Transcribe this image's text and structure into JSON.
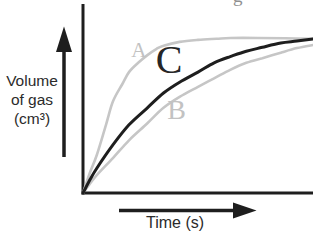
{
  "figure": {
    "cropped_text_fragment": "g",
    "background_color": "#ffffff"
  },
  "chart_data": {
    "type": "line",
    "title": "",
    "xlabel": "Time (s)",
    "ylabel": "Volume of gas (cm³)",
    "ylabel_lines": [
      "Volume",
      "of gas",
      "(cm³)"
    ],
    "x_range": [
      0,
      100
    ],
    "y_range": [
      0,
      100
    ],
    "grid": false,
    "axis_arrows": true,
    "axis_color": "#1e1e1e",
    "text_color": "#2b2b2b",
    "series": [
      {
        "name": "A",
        "color": "#c6c6c6",
        "points": [
          [
            0,
            0
          ],
          [
            3,
            13
          ],
          [
            6,
            24.5
          ],
          [
            10,
            44
          ],
          [
            13,
            59
          ],
          [
            17,
            70
          ],
          [
            20,
            78
          ],
          [
            24,
            84
          ],
          [
            28,
            89
          ],
          [
            32,
            93
          ],
          [
            35,
            95
          ],
          [
            42,
            97.5
          ],
          [
            50,
            98.8
          ],
          [
            58,
            99.5
          ],
          [
            64,
            100
          ],
          [
            76,
            100
          ],
          [
            88,
            99.8
          ],
          [
            100,
            99.5
          ]
        ]
      },
      {
        "name": "B",
        "color": "#c6c6c6",
        "points": [
          [
            0,
            0
          ],
          [
            3,
            6
          ],
          [
            6,
            11.5
          ],
          [
            13,
            22.5
          ],
          [
            20,
            34
          ],
          [
            28,
            45
          ],
          [
            35,
            55
          ],
          [
            42,
            62
          ],
          [
            50,
            68.5
          ],
          [
            57,
            74
          ],
          [
            64,
            79.5
          ],
          [
            71,
            84
          ],
          [
            78,
            87
          ],
          [
            86,
            90.5
          ],
          [
            93,
            93.5
          ],
          [
            100,
            95.5
          ]
        ]
      },
      {
        "name": "C",
        "color": "#1e1e1e",
        "points": [
          [
            0,
            0
          ],
          [
            3,
            8.5
          ],
          [
            6,
            16
          ],
          [
            13,
            31
          ],
          [
            20,
            44
          ],
          [
            28,
            55
          ],
          [
            35,
            64.5
          ],
          [
            42,
            71.5
          ],
          [
            50,
            78
          ],
          [
            57,
            84
          ],
          [
            64,
            88
          ],
          [
            71,
            91.5
          ],
          [
            78,
            94
          ],
          [
            86,
            96.8
          ],
          [
            93,
            98
          ],
          [
            100,
            99.4
          ]
        ]
      }
    ],
    "annotations": [
      {
        "text": "A",
        "t": 24.3,
        "v": 91,
        "color": "#c2c2c2",
        "font_px": 21
      },
      {
        "text": "B",
        "t": 40.7,
        "v": 52.3,
        "color": "#c2c2c2",
        "font_px": 28
      },
      {
        "text": "C",
        "t": 37.4,
        "v": 84.2,
        "color": "#262626",
        "font_px": 40
      }
    ]
  }
}
